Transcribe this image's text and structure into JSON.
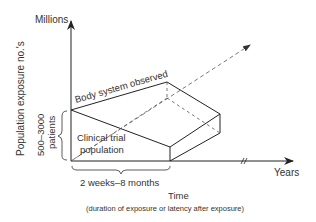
{
  "diagram": {
    "y_axis": {
      "top_label": "Millions",
      "title": "Population exposure no.'s"
    },
    "x_axis": {
      "end_label": "Years",
      "title": "Time",
      "subtitle": "(duration of exposure or latency after exposure)"
    },
    "regions": {
      "outer": "Body system observed",
      "inner_line1": "Clinical trial",
      "inner_line2": "population"
    },
    "brackets": {
      "vertical_line1": "500–3000",
      "vertical_line2": "patients",
      "horizontal": "2 weeks–8 months"
    },
    "colors": {
      "line": "#222222",
      "text": "#333333",
      "dashed": "#555555"
    }
  }
}
